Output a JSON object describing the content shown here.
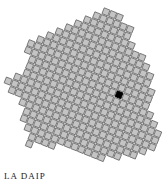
{
  "game": {
    "caption": "LA DAIP",
    "tile_color": "#c4c4c4",
    "tile_border": "#6a6a6a",
    "marked_color": "#000000",
    "grid": {
      "pitch": 7.2,
      "angle_deg": 22,
      "origin": [
        83,
        88
      ]
    },
    "outline": [
      [
        112,
        7
      ],
      [
        128,
        22
      ],
      [
        136,
        48
      ],
      [
        148,
        66
      ],
      [
        152,
        86
      ],
      [
        150,
        106
      ],
      [
        160,
        138
      ],
      [
        150,
        153
      ],
      [
        128,
        158
      ],
      [
        98,
        160
      ],
      [
        72,
        153
      ],
      [
        40,
        141
      ],
      [
        30,
        148
      ],
      [
        22,
        120
      ],
      [
        20,
        102
      ],
      [
        8,
        95
      ],
      [
        4,
        80
      ],
      [
        14,
        75
      ],
      [
        28,
        70
      ],
      [
        24,
        48
      ],
      [
        48,
        32
      ],
      [
        72,
        22
      ],
      [
        100,
        11
      ]
    ],
    "marked_tile": {
      "x": 117,
      "y": 95
    }
  }
}
